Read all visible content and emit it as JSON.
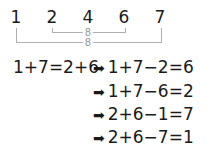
{
  "numbers": [
    "1",
    "2",
    "4",
    "6",
    "7"
  ],
  "brackets": {
    "inner": {
      "from": "2",
      "to": "6",
      "label": "8"
    },
    "outer": {
      "from": "1",
      "to": "7",
      "label": "8"
    }
  },
  "equations": {
    "premise": "1+7=2+6",
    "arrow": "➡",
    "derived": [
      "1+7−2=6",
      "1+7−6=2",
      "2+6−1=7",
      "2+6−7=1"
    ]
  }
}
